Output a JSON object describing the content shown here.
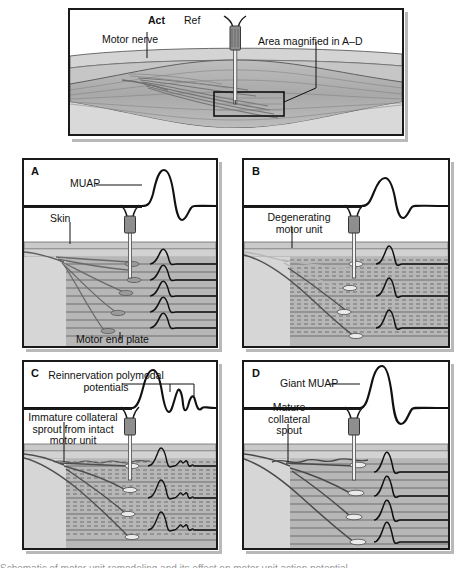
{
  "overview": {
    "labels": {
      "active_electrode": "Act",
      "reference_electrode": "Ref",
      "motor_nerve": "Motor nerve",
      "magnified_area": "Area magnified in A–D"
    }
  },
  "panels": [
    {
      "letter": "A",
      "state": "normal-motor-unit",
      "waveform_label": "MUAP",
      "labels": [
        "Skin",
        "Motor end plate"
      ],
      "fiber_count": 5,
      "waveform": "normal biphasic motor unit action potential"
    },
    {
      "letter": "B",
      "state": "degenerating-motor-unit",
      "waveform_label": "",
      "labels": [
        "Degenerating motor unit"
      ],
      "fiber_count": 3,
      "waveform": "reduced amplitude motor unit action potential"
    },
    {
      "letter": "C",
      "state": "early-reinnervation",
      "waveform_label": "Reinnervation polymodal potentials",
      "labels": [
        "Immature collateral sprout from intact motor unit"
      ],
      "fiber_count": 3,
      "waveform": "polyphasic potential with multiple late satellite peaks"
    },
    {
      "letter": "D",
      "state": "mature-reinnervation",
      "waveform_label": "Giant MUAP",
      "labels": [
        "Mature collateral spout"
      ],
      "fiber_count": 4,
      "waveform": "large amplitude long duration giant motor unit action potential"
    }
  ],
  "colors": {
    "ink": "#1a1a1a",
    "skin": "#d8d8d8",
    "subcutaneous": "#c9c9c9",
    "muscle": "#b4b4b4",
    "fiber_line": "#6e6e6e",
    "nerve": "#707070",
    "needle_hub": "#8c8c8c",
    "panel_shadow": "#b9b9b9"
  },
  "caption": {
    "text": "Schematic of motor unit remodeling and its effect on motor unit action potential"
  }
}
